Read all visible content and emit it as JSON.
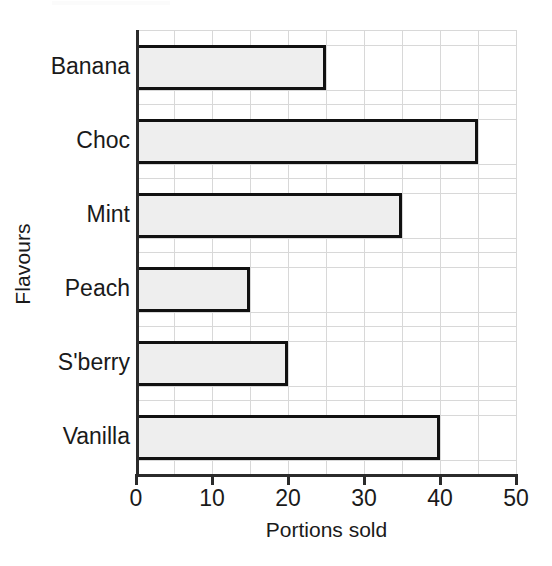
{
  "chart_data": {
    "type": "bar",
    "orientation": "horizontal",
    "title": "",
    "xlabel": "Portions sold",
    "ylabel": "Flavours",
    "categories": [
      "Banana",
      "Choc",
      "Mint",
      "Peach",
      "S'berry",
      "Vanilla"
    ],
    "values": [
      25,
      45,
      35,
      15,
      20,
      40
    ],
    "xlim": [
      0,
      50
    ],
    "xticks": [
      0,
      10,
      20,
      30,
      40,
      50
    ],
    "xtick_labels": [
      "0",
      "10",
      "20",
      "30",
      "40",
      "50"
    ],
    "minor_gridline_step": 5,
    "grid": true,
    "legend": false,
    "colors": {
      "bar_fill": "#eeeeee",
      "bar_border": "#111111",
      "gridline": "#d8d8d8",
      "axis": "#2b2b2b",
      "text": "#1a1a1a",
      "background": "#ffffff"
    }
  }
}
